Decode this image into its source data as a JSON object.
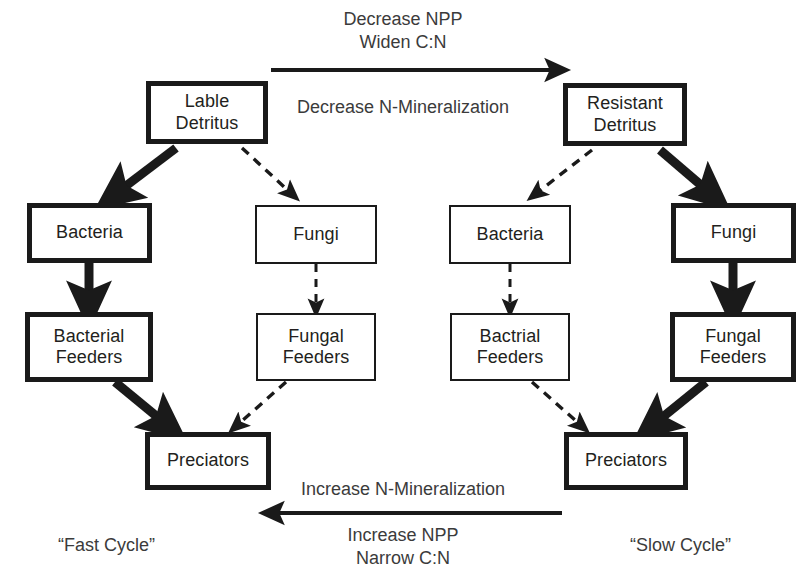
{
  "diagram": {
    "title_visible": false,
    "ink_color": "#1a1a1a",
    "text_color": "#333333",
    "nodes": {
      "labile_detritus": {
        "line1": "Lable",
        "line2": "Detritus"
      },
      "resistant_detritus": {
        "line1": "Resistant",
        "line2": "Detritus"
      },
      "fast_bacteria": {
        "line1": "Bacteria",
        "line2": ""
      },
      "fast_fungi": {
        "line1": "Fungi",
        "line2": ""
      },
      "slow_bacteria": {
        "line1": "Bacteria",
        "line2": ""
      },
      "slow_fungi": {
        "line1": "Fungi",
        "line2": ""
      },
      "fast_bacterial_feeders": {
        "line1": "Bacterial",
        "line2": "Feeders"
      },
      "fast_fungal_feeders": {
        "line1": "Fungal",
        "line2": "Feeders"
      },
      "slow_bacterial_feeders": {
        "line1": "Bactrial",
        "line2": "Feeders"
      },
      "slow_fungal_feeders": {
        "line1": "Fungal",
        "line2": "Feeders"
      },
      "fast_predators": {
        "line1": "Preciators",
        "line2": ""
      },
      "slow_predators": {
        "line1": "Preciators",
        "line2": ""
      }
    },
    "annotations": {
      "top_above_arrow_line1": "Decrease NPP",
      "top_above_arrow_line2": "Widen C:N",
      "top_below_arrow": "Decrease N-Mineralization",
      "bottom_above_arrow": "Increase N-Mineralization",
      "bottom_below_arrow_line1": "Increase NPP",
      "bottom_below_arrow_line2": "Narrow C:N"
    },
    "cycle_labels": {
      "left": "“Fast Cycle”",
      "right": "“Slow Cycle”"
    }
  }
}
